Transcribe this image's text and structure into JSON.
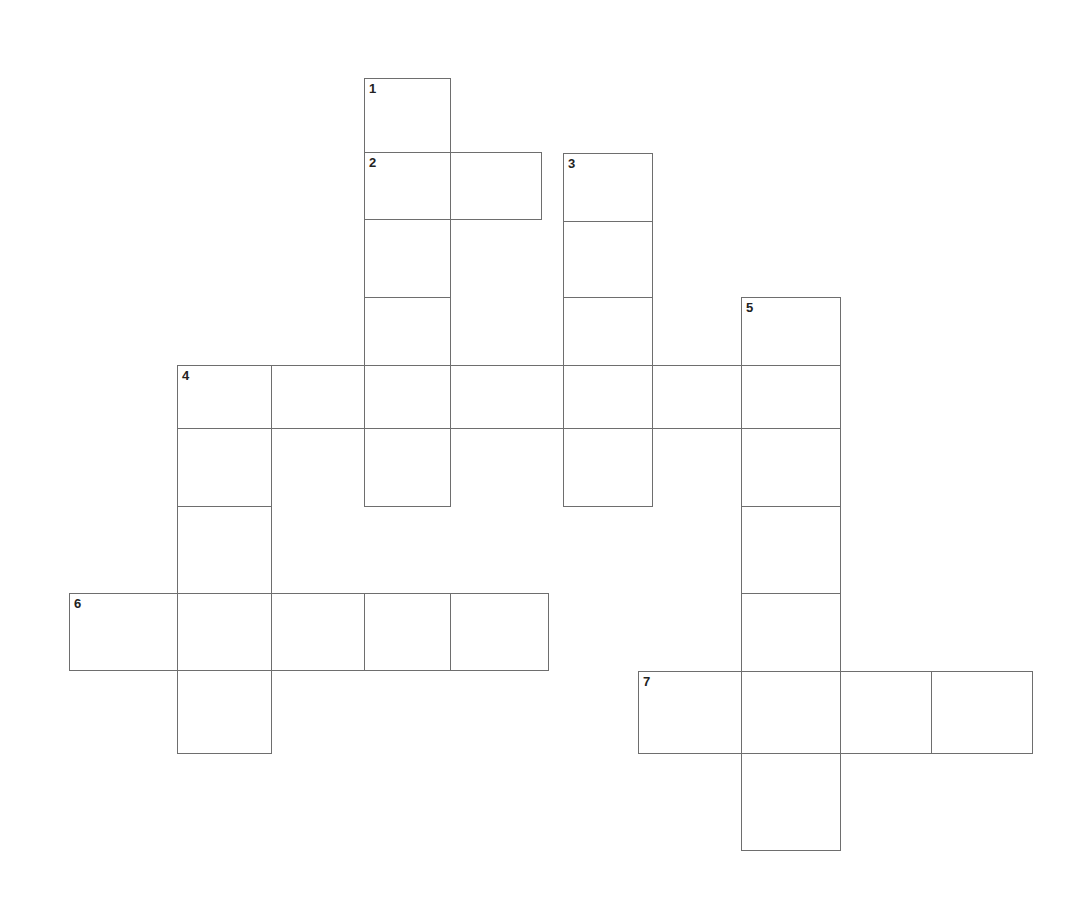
{
  "puzzle": {
    "type": "crossword",
    "border_color": "#6e6e6e",
    "background": "#ffffff",
    "cells": [
      {
        "x": 364,
        "y": 78,
        "w": 86,
        "h": 74,
        "num": "1",
        "letter": ""
      },
      {
        "x": 364,
        "y": 152,
        "w": 86,
        "h": 67,
        "num": "2",
        "letter": ""
      },
      {
        "x": 450,
        "y": 152,
        "w": 91,
        "h": 67,
        "num": "",
        "letter": ""
      },
      {
        "x": 364,
        "y": 219,
        "w": 86,
        "h": 78,
        "num": "",
        "letter": ""
      },
      {
        "x": 364,
        "y": 297,
        "w": 86,
        "h": 68,
        "num": "",
        "letter": ""
      },
      {
        "x": 364,
        "y": 428,
        "w": 86,
        "h": 78,
        "num": "",
        "letter": ""
      },
      {
        "x": 563,
        "y": 153,
        "w": 89,
        "h": 68,
        "num": "3",
        "letter": ""
      },
      {
        "x": 563,
        "y": 221,
        "w": 89,
        "h": 76,
        "num": "",
        "letter": ""
      },
      {
        "x": 563,
        "y": 297,
        "w": 89,
        "h": 68,
        "num": "",
        "letter": ""
      },
      {
        "x": 563,
        "y": 428,
        "w": 89,
        "h": 78,
        "num": "",
        "letter": ""
      },
      {
        "x": 741,
        "y": 297,
        "w": 99,
        "h": 68,
        "num": "5",
        "letter": ""
      },
      {
        "x": 177,
        "y": 365,
        "w": 94,
        "h": 63,
        "num": "4",
        "letter": ""
      },
      {
        "x": 271,
        "y": 365,
        "w": 93,
        "h": 63,
        "num": "",
        "letter": ""
      },
      {
        "x": 364,
        "y": 365,
        "w": 86,
        "h": 63,
        "num": "",
        "letter": ""
      },
      {
        "x": 450,
        "y": 365,
        "w": 113,
        "h": 63,
        "num": "",
        "letter": ""
      },
      {
        "x": 563,
        "y": 365,
        "w": 89,
        "h": 63,
        "num": "",
        "letter": ""
      },
      {
        "x": 652,
        "y": 365,
        "w": 89,
        "h": 63,
        "num": "",
        "letter": ""
      },
      {
        "x": 741,
        "y": 365,
        "w": 99,
        "h": 63,
        "num": "",
        "letter": ""
      },
      {
        "x": 177,
        "y": 428,
        "w": 94,
        "h": 78,
        "num": "",
        "letter": ""
      },
      {
        "x": 177,
        "y": 506,
        "w": 94,
        "h": 87,
        "num": "",
        "letter": ""
      },
      {
        "x": 177,
        "y": 670,
        "w": 94,
        "h": 83,
        "num": "",
        "letter": ""
      },
      {
        "x": 741,
        "y": 428,
        "w": 99,
        "h": 78,
        "num": "",
        "letter": ""
      },
      {
        "x": 741,
        "y": 506,
        "w": 99,
        "h": 87,
        "num": "",
        "letter": ""
      },
      {
        "x": 741,
        "y": 593,
        "w": 99,
        "h": 78,
        "num": "",
        "letter": ""
      },
      {
        "x": 741,
        "y": 753,
        "w": 99,
        "h": 97,
        "num": "",
        "letter": ""
      },
      {
        "x": 69,
        "y": 593,
        "w": 108,
        "h": 77,
        "num": "6",
        "letter": ""
      },
      {
        "x": 177,
        "y": 593,
        "w": 94,
        "h": 77,
        "num": "",
        "letter": ""
      },
      {
        "x": 271,
        "y": 593,
        "w": 93,
        "h": 77,
        "num": "",
        "letter": ""
      },
      {
        "x": 364,
        "y": 593,
        "w": 86,
        "h": 77,
        "num": "",
        "letter": ""
      },
      {
        "x": 450,
        "y": 593,
        "w": 98,
        "h": 77,
        "num": "",
        "letter": ""
      },
      {
        "x": 638,
        "y": 671,
        "w": 103,
        "h": 82,
        "num": "7",
        "letter": ""
      },
      {
        "x": 741,
        "y": 671,
        "w": 99,
        "h": 82,
        "num": "",
        "letter": ""
      },
      {
        "x": 840,
        "y": 671,
        "w": 91,
        "h": 82,
        "num": "",
        "letter": ""
      },
      {
        "x": 931,
        "y": 671,
        "w": 101,
        "h": 82,
        "num": "",
        "letter": ""
      }
    ],
    "entries": [
      {
        "number": "1",
        "direction": "down",
        "length": 6
      },
      {
        "number": "2",
        "direction": "across",
        "length": 2
      },
      {
        "number": "3",
        "direction": "down",
        "length": 5
      },
      {
        "number": "4",
        "direction": "across",
        "length": 7
      },
      {
        "number": "4",
        "direction": "down",
        "length": 5
      },
      {
        "number": "5",
        "direction": "down",
        "length": 7
      },
      {
        "number": "6",
        "direction": "across",
        "length": 5
      },
      {
        "number": "7",
        "direction": "across",
        "length": 4
      }
    ]
  }
}
